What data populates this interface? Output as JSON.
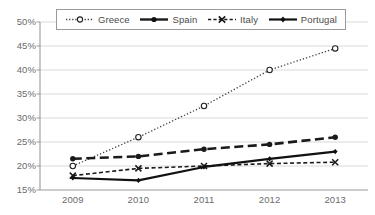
{
  "chart_data": {
    "type": "line",
    "title": "",
    "subtitle": "",
    "xlabel": "",
    "ylabel": "",
    "categories": [
      "2009",
      "2010",
      "2011",
      "2012",
      "2013"
    ],
    "x": [
      2009,
      2010,
      2011,
      2012,
      2013
    ],
    "ylim": [
      15,
      50
    ],
    "ytick_labels": [
      "50%",
      "45%",
      "40%",
      "35%",
      "30%",
      "25%",
      "20%",
      "15%"
    ],
    "ytick_values": [
      50,
      45,
      40,
      35,
      30,
      25,
      20,
      15
    ],
    "ytick_format": "percent",
    "grid": "horizontal",
    "legend_position": "top-center",
    "legend_border": true,
    "series": [
      {
        "name": "Greece",
        "values": [
          20.0,
          26.0,
          32.5,
          40.0,
          44.5
        ],
        "style": "dotted",
        "marker": "open-circle",
        "color": "#3f3f3f",
        "width": 1.3
      },
      {
        "name": "Spain",
        "values": [
          21.5,
          22.0,
          23.5,
          24.5,
          26.0
        ],
        "style": "long-dash",
        "marker": "filled-circle",
        "color": "#1a1a1a",
        "width": 2.6
      },
      {
        "name": "Italy",
        "values": [
          18.0,
          19.5,
          20.0,
          20.5,
          20.8
        ],
        "style": "short-dash",
        "marker": "cross-x",
        "color": "#1a1a1a",
        "width": 1.6
      },
      {
        "name": "Portugal",
        "values": [
          17.5,
          17.0,
          19.8,
          21.5,
          23.0
        ],
        "style": "solid",
        "marker": "filled-diamond",
        "color": "#111111",
        "width": 2.2
      }
    ]
  },
  "axes": {
    "y_ticks": [
      {
        "label": "50%",
        "value": 50
      },
      {
        "label": "45%",
        "value": 45
      },
      {
        "label": "40%",
        "value": 40
      },
      {
        "label": "35%",
        "value": 35
      },
      {
        "label": "30%",
        "value": 30
      },
      {
        "label": "25%",
        "value": 25
      },
      {
        "label": "20%",
        "value": 20
      },
      {
        "label": "15%",
        "value": 15
      }
    ],
    "x_ticks": [
      {
        "label": "2009"
      },
      {
        "label": "2010"
      },
      {
        "label": "2011"
      },
      {
        "label": "2012"
      },
      {
        "label": "2013"
      }
    ]
  },
  "legend": {
    "entries": [
      {
        "label": "Greece",
        "key_icon": "dotted-line-open-circle-marker"
      },
      {
        "label": "Spain",
        "key_icon": "dashed-line-filled-circle-marker"
      },
      {
        "label": "Italy",
        "key_icon": "dashed-line-cross-marker"
      },
      {
        "label": "Portugal",
        "key_icon": "solid-line-filled-marker"
      }
    ]
  },
  "colors": {
    "grid": "#d9d9d9",
    "axis": "#9a9a9a",
    "text": "#6b6b6b",
    "legend_border": "#9a9a9a",
    "background": "#ffffff"
  }
}
